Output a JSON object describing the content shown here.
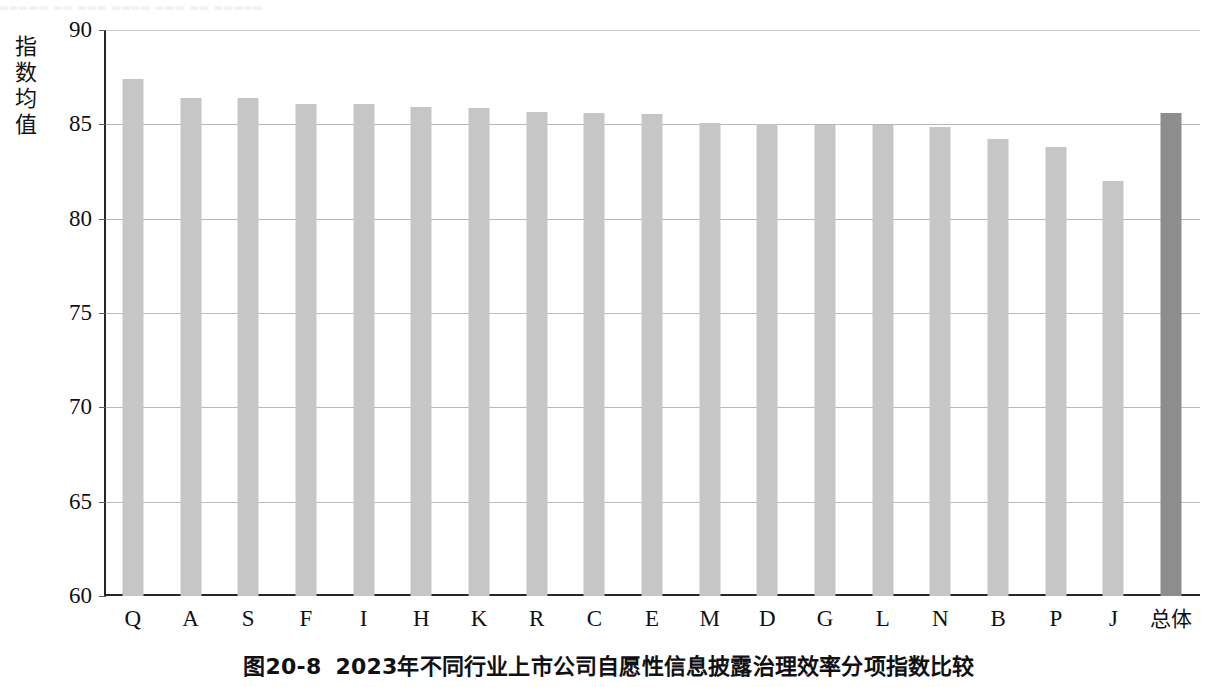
{
  "page": {
    "top_bleed_text": "▄▄▄▄▄  ▄▄   ▄▄▄  ▄▄▄▄  ▄▄▄ ▄▄  ▄▄▄▄▄"
  },
  "caption": {
    "number": "图20-8",
    "text": "2023年不同行业上市公司自愿性信息披露治理效率分项指数比较"
  },
  "axis": {
    "y_title": "指数均值",
    "y_ticks": [
      "90",
      "85",
      "80",
      "75",
      "70",
      "65",
      "60"
    ]
  },
  "chart_data": {
    "type": "bar",
    "title": "2023年不同行业上市公司自愿性信息披露治理效率分项指数比较",
    "xlabel": "",
    "ylabel": "指数均值",
    "ylim": [
      60,
      90
    ],
    "ytick_step": 5,
    "grid": true,
    "legend": "none",
    "bar_color": "#c6c6c6",
    "highlight_color": "#8d8d8d",
    "highlight_index": 18,
    "categories": [
      "Q",
      "A",
      "S",
      "F",
      "I",
      "H",
      "K",
      "R",
      "C",
      "E",
      "M",
      "D",
      "G",
      "L",
      "N",
      "B",
      "P",
      "J",
      "总体"
    ],
    "values": [
      87.4,
      86.4,
      86.4,
      86.1,
      86.1,
      85.9,
      85.85,
      85.65,
      85.6,
      85.55,
      85.05,
      85.0,
      84.95,
      84.95,
      84.85,
      84.2,
      83.8,
      82.0,
      85.6
    ]
  }
}
